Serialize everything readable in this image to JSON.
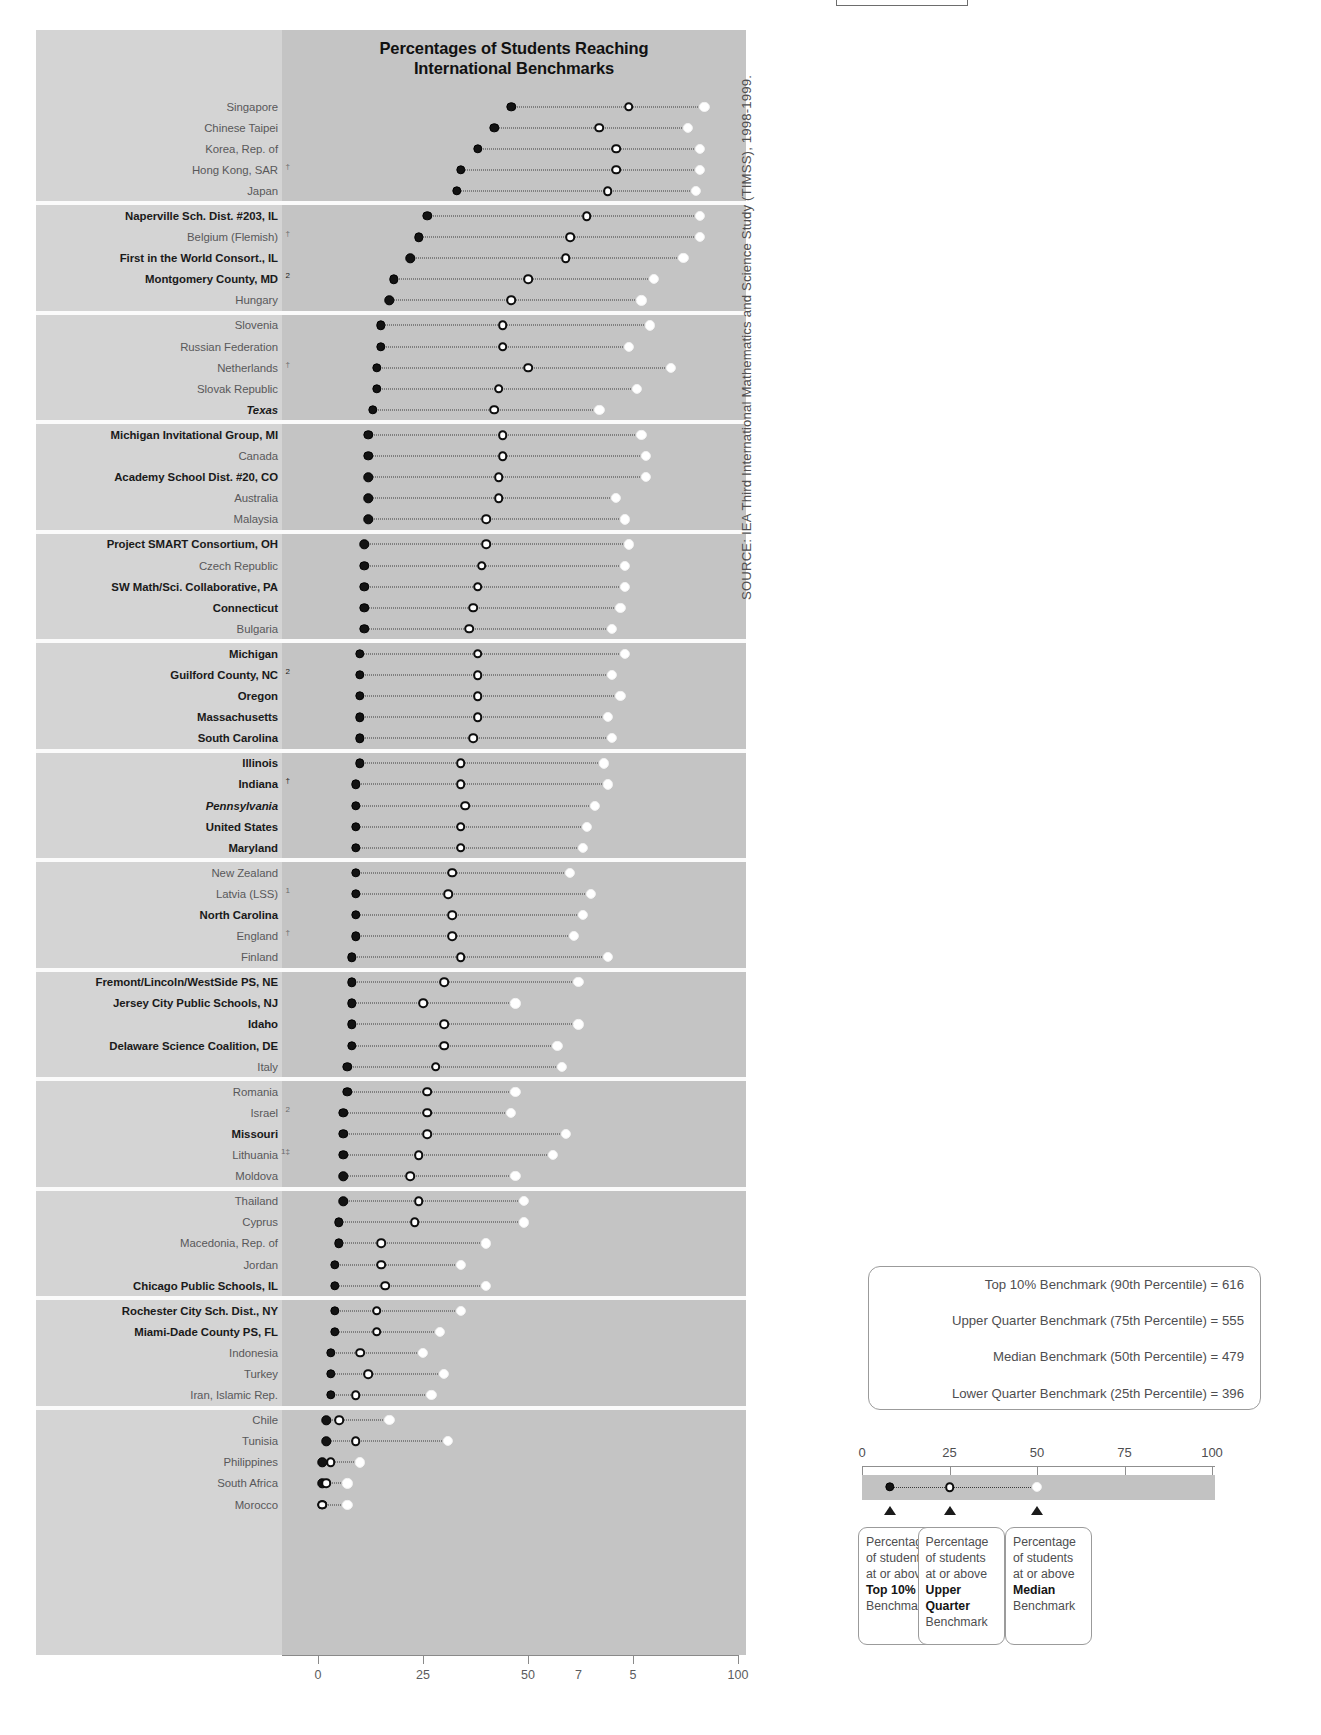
{
  "chart_title": "Percentages of Students Reaching\nInternational Benchmarks",
  "chart_title_line1": "Percentages of Students Reaching",
  "chart_title_line2": "International Benchmarks",
  "source_note": "SOURCE: IEA Third International Mathematics and Science Study (TIMSS), 1998-1999.",
  "benchmark_box": {
    "lines": [
      "Top 10% Benchmark (90th Percentile) = 616",
      "Upper Quarter Benchmark (75th Percentile) = 555",
      "Median Benchmark (50th Percentile) = 479",
      "Lower Quarter Benchmark (25th Percentile) = 396"
    ]
  },
  "legend_scale": {
    "ticks": [
      0,
      25,
      50,
      75,
      100
    ],
    "tick_labels": [
      "0",
      "25",
      "50",
      "75",
      "100"
    ],
    "demo_top10": 8,
    "demo_upper": 25,
    "demo_median": 50,
    "arrow_positions": [
      8,
      25,
      50
    ]
  },
  "callouts": [
    {
      "l1": "Percentage",
      "l2": "of students",
      "l3": "at or above",
      "bold": "Top 10%",
      "l5": "Benchmark",
      "bold2": ""
    },
    {
      "l1": "Percentage",
      "l2": "of students",
      "l3": "at or above",
      "bold": "Upper",
      "bold2": "Quarter",
      "l5": "Benchmark"
    },
    {
      "l1": "Percentage",
      "l2": "of students",
      "l3": "at or above",
      "bold": "Median",
      "l5": "Benchmark",
      "bold2": ""
    }
  ],
  "chart_data": {
    "type": "scatter",
    "title": "Percentages of Students Reaching International Benchmarks",
    "xlabel": "",
    "ylabel": "",
    "xlim": [
      0,
      100
    ],
    "grid": false,
    "legend_position": "below-right",
    "axis_tick_labels": [
      "0",
      "25",
      "50",
      "7",
      "5",
      "100"
    ],
    "axis_tick_values": [
      0,
      25,
      50,
      75,
      100
    ],
    "series": [
      {
        "name": "Percentage of students at or above Top 10% Benchmark",
        "marker": "filled-black"
      },
      {
        "name": "Percentage of students at or above Upper Quarter Benchmark",
        "marker": "open-circle"
      },
      {
        "name": "Percentage of students at or above Median Benchmark",
        "marker": "filled-white"
      }
    ],
    "rows": [
      {
        "label": "Singapore",
        "style": "normal",
        "sup": "",
        "top10": 46,
        "upper": 74,
        "median": 92,
        "band": 0
      },
      {
        "label": "Chinese Taipei",
        "style": "normal",
        "sup": "",
        "top10": 42,
        "upper": 67,
        "median": 88,
        "band": 0
      },
      {
        "label": "Korea, Rep. of",
        "style": "normal",
        "sup": "",
        "top10": 38,
        "upper": 71,
        "median": 91,
        "band": 0
      },
      {
        "label": "Hong Kong, SAR",
        "style": "normal",
        "sup": "†",
        "top10": 34,
        "upper": 71,
        "median": 91,
        "band": 0
      },
      {
        "label": "Japan",
        "style": "normal",
        "sup": "",
        "top10": 33,
        "upper": 69,
        "median": 90,
        "band": 0
      },
      {
        "label": "Naperville Sch. Dist. #203, IL",
        "style": "bold",
        "sup": "",
        "top10": 26,
        "upper": 64,
        "median": 91,
        "band": 1
      },
      {
        "label": "Belgium (Flemish)",
        "style": "normal",
        "sup": "†",
        "top10": 24,
        "upper": 60,
        "median": 91,
        "band": 1
      },
      {
        "label": "First in the World Consort., IL",
        "style": "bold",
        "sup": "",
        "top10": 22,
        "upper": 59,
        "median": 87,
        "band": 1
      },
      {
        "label": "Montgomery County, MD",
        "style": "bold",
        "sup": "2",
        "top10": 18,
        "upper": 50,
        "median": 80,
        "band": 1
      },
      {
        "label": "Hungary",
        "style": "normal",
        "sup": "",
        "top10": 17,
        "upper": 46,
        "median": 77,
        "band": 1
      },
      {
        "label": "Slovenia",
        "style": "normal",
        "sup": "",
        "top10": 15,
        "upper": 44,
        "median": 79,
        "band": 2
      },
      {
        "label": "Russian Federation",
        "style": "normal",
        "sup": "",
        "top10": 15,
        "upper": 44,
        "median": 74,
        "band": 2
      },
      {
        "label": "Netherlands",
        "style": "normal",
        "sup": "†",
        "top10": 14,
        "upper": 50,
        "median": 84,
        "band": 2
      },
      {
        "label": "Slovak Republic",
        "style": "normal",
        "sup": "",
        "top10": 14,
        "upper": 43,
        "median": 76,
        "band": 2
      },
      {
        "label": "Texas",
        "style": "italic",
        "sup": "",
        "top10": 13,
        "upper": 42,
        "median": 67,
        "band": 2
      },
      {
        "label": "Michigan Invitational Group, MI",
        "style": "bold",
        "sup": "",
        "top10": 12,
        "upper": 44,
        "median": 77,
        "band": 3
      },
      {
        "label": "Canada",
        "style": "normal",
        "sup": "",
        "top10": 12,
        "upper": 44,
        "median": 78,
        "band": 3
      },
      {
        "label": "Academy School Dist. #20, CO",
        "style": "bold",
        "sup": "",
        "top10": 12,
        "upper": 43,
        "median": 78,
        "band": 3
      },
      {
        "label": "Australia",
        "style": "normal",
        "sup": "",
        "top10": 12,
        "upper": 43,
        "median": 71,
        "band": 3
      },
      {
        "label": "Malaysia",
        "style": "normal",
        "sup": "",
        "top10": 12,
        "upper": 40,
        "median": 73,
        "band": 3
      },
      {
        "label": "Project SMART Consortium, OH",
        "style": "bold",
        "sup": "",
        "top10": 11,
        "upper": 40,
        "median": 74,
        "band": 4
      },
      {
        "label": "Czech Republic",
        "style": "normal",
        "sup": "",
        "top10": 11,
        "upper": 39,
        "median": 73,
        "band": 4
      },
      {
        "label": "SW Math/Sci. Collaborative, PA",
        "style": "bold",
        "sup": "",
        "top10": 11,
        "upper": 38,
        "median": 73,
        "band": 4
      },
      {
        "label": "Connecticut",
        "style": "bold",
        "sup": "",
        "top10": 11,
        "upper": 37,
        "median": 72,
        "band": 4
      },
      {
        "label": "Bulgaria",
        "style": "normal",
        "sup": "",
        "top10": 11,
        "upper": 36,
        "median": 70,
        "band": 4
      },
      {
        "label": "Michigan",
        "style": "bold",
        "sup": "",
        "top10": 10,
        "upper": 38,
        "median": 73,
        "band": 5
      },
      {
        "label": "Guilford County, NC",
        "style": "bold",
        "sup": "2",
        "top10": 10,
        "upper": 38,
        "median": 70,
        "band": 5
      },
      {
        "label": "Oregon",
        "style": "bold",
        "sup": "",
        "top10": 10,
        "upper": 38,
        "median": 72,
        "band": 5
      },
      {
        "label": "Massachusetts",
        "style": "bold",
        "sup": "",
        "top10": 10,
        "upper": 38,
        "median": 69,
        "band": 5
      },
      {
        "label": "South Carolina",
        "style": "bold",
        "sup": "",
        "top10": 10,
        "upper": 37,
        "median": 70,
        "band": 5
      },
      {
        "label": "Illinois",
        "style": "bold",
        "sup": "",
        "top10": 10,
        "upper": 34,
        "median": 68,
        "band": 6
      },
      {
        "label": "Indiana",
        "style": "bold",
        "sup": "†",
        "top10": 9,
        "upper": 34,
        "median": 69,
        "band": 6
      },
      {
        "label": "Pennsylvania",
        "style": "italic",
        "sup": "",
        "top10": 9,
        "upper": 35,
        "median": 66,
        "band": 6
      },
      {
        "label": "United States",
        "style": "bold",
        "sup": "",
        "top10": 9,
        "upper": 34,
        "median": 64,
        "band": 6
      },
      {
        "label": "Maryland",
        "style": "bold",
        "sup": "",
        "top10": 9,
        "upper": 34,
        "median": 63,
        "band": 6
      },
      {
        "label": "New Zealand",
        "style": "normal",
        "sup": "",
        "top10": 9,
        "upper": 32,
        "median": 60,
        "band": 7
      },
      {
        "label": "Latvia (LSS)",
        "style": "normal",
        "sup": "1",
        "top10": 9,
        "upper": 31,
        "median": 65,
        "band": 7
      },
      {
        "label": "North Carolina",
        "style": "bold",
        "sup": "",
        "top10": 9,
        "upper": 32,
        "median": 63,
        "band": 7
      },
      {
        "label": "England",
        "style": "normal",
        "sup": "†",
        "top10": 9,
        "upper": 32,
        "median": 61,
        "band": 7
      },
      {
        "label": "Finland",
        "style": "normal",
        "sup": "",
        "top10": 8,
        "upper": 34,
        "median": 69,
        "band": 7
      },
      {
        "label": "Fremont/Lincoln/WestSide PS, NE",
        "style": "bold",
        "sup": "",
        "top10": 8,
        "upper": 30,
        "median": 62,
        "band": 8
      },
      {
        "label": "Jersey City Public Schools, NJ",
        "style": "bold",
        "sup": "",
        "top10": 8,
        "upper": 25,
        "median": 47,
        "band": 8
      },
      {
        "label": "Idaho",
        "style": "bold",
        "sup": "",
        "top10": 8,
        "upper": 30,
        "median": 62,
        "band": 8
      },
      {
        "label": "Delaware Science Coalition, DE",
        "style": "bold",
        "sup": "",
        "top10": 8,
        "upper": 30,
        "median": 57,
        "band": 8
      },
      {
        "label": "Italy",
        "style": "normal",
        "sup": "",
        "top10": 7,
        "upper": 28,
        "median": 58,
        "band": 8
      },
      {
        "label": "Romania",
        "style": "normal",
        "sup": "",
        "top10": 7,
        "upper": 26,
        "median": 47,
        "band": 9
      },
      {
        "label": "Israel",
        "style": "normal",
        "sup": "2",
        "top10": 6,
        "upper": 26,
        "median": 46,
        "band": 9
      },
      {
        "label": "Missouri",
        "style": "bold",
        "sup": "",
        "top10": 6,
        "upper": 26,
        "median": 59,
        "band": 9
      },
      {
        "label": "Lithuania",
        "style": "normal",
        "sup": "1‡",
        "top10": 6,
        "upper": 24,
        "median": 56,
        "band": 9
      },
      {
        "label": "Moldova",
        "style": "normal",
        "sup": "",
        "top10": 6,
        "upper": 22,
        "median": 47,
        "band": 9
      },
      {
        "label": "Thailand",
        "style": "normal",
        "sup": "",
        "top10": 6,
        "upper": 24,
        "median": 49,
        "band": 10
      },
      {
        "label": "Cyprus",
        "style": "normal",
        "sup": "",
        "top10": 5,
        "upper": 23,
        "median": 49,
        "band": 10
      },
      {
        "label": "Macedonia, Rep. of",
        "style": "normal",
        "sup": "",
        "top10": 5,
        "upper": 15,
        "median": 40,
        "band": 10
      },
      {
        "label": "Jordan",
        "style": "normal",
        "sup": "",
        "top10": 4,
        "upper": 15,
        "median": 34,
        "band": 10
      },
      {
        "label": "Chicago Public Schools, IL",
        "style": "bold",
        "sup": "",
        "top10": 4,
        "upper": 16,
        "median": 40,
        "band": 10
      },
      {
        "label": "Rochester City Sch. Dist., NY",
        "style": "bold",
        "sup": "",
        "top10": 4,
        "upper": 14,
        "median": 34,
        "band": 11
      },
      {
        "label": "Miami-Dade County PS, FL",
        "style": "bold",
        "sup": "",
        "top10": 4,
        "upper": 14,
        "median": 29,
        "band": 11
      },
      {
        "label": "Indonesia",
        "style": "normal",
        "sup": "",
        "top10": 3,
        "upper": 10,
        "median": 25,
        "band": 11
      },
      {
        "label": "Turkey",
        "style": "normal",
        "sup": "",
        "top10": 3,
        "upper": 12,
        "median": 30,
        "band": 11
      },
      {
        "label": "Iran, Islamic Rep.",
        "style": "normal",
        "sup": "",
        "top10": 3,
        "upper": 9,
        "median": 27,
        "band": 11
      },
      {
        "label": "Chile",
        "style": "normal",
        "sup": "",
        "top10": 2,
        "upper": 5,
        "median": 17,
        "band": 12
      },
      {
        "label": "Tunisia",
        "style": "normal",
        "sup": "",
        "top10": 2,
        "upper": 9,
        "median": 31,
        "band": 12
      },
      {
        "label": "Philippines",
        "style": "normal",
        "sup": "",
        "top10": 1,
        "upper": 3,
        "median": 10,
        "band": 12
      },
      {
        "label": "South Africa",
        "style": "normal",
        "sup": "",
        "top10": 1,
        "upper": 2,
        "median": 7,
        "band": 12
      },
      {
        "label": "Morocco",
        "style": "normal",
        "sup": "",
        "top10": 1,
        "upper": 1,
        "median": 7,
        "band": 12
      }
    ]
  }
}
